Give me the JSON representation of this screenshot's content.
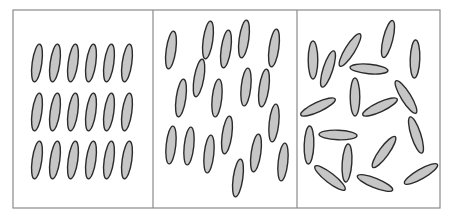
{
  "diagram": {
    "title": "",
    "style": {
      "rod_fill": "#c6c6c6",
      "rod_stroke": "#2b2b2b",
      "frame_stroke": "#8a8a8a",
      "rod_rx": 4.8,
      "rod_ry": 19
    },
    "frame": {
      "x": 13,
      "y": 10,
      "width": 427,
      "height": 198
    },
    "panels": [
      {
        "name": "ordered-lattice",
        "x": 13,
        "width": 140,
        "rods": [
          {
            "cx": 37,
            "cy": 63,
            "angle": 8
          },
          {
            "cx": 55,
            "cy": 63,
            "angle": 8
          },
          {
            "cx": 73,
            "cy": 63,
            "angle": 8
          },
          {
            "cx": 91,
            "cy": 63,
            "angle": 8
          },
          {
            "cx": 109,
            "cy": 63,
            "angle": 8
          },
          {
            "cx": 127,
            "cy": 63,
            "angle": 8
          },
          {
            "cx": 37,
            "cy": 112,
            "angle": 8
          },
          {
            "cx": 55,
            "cy": 112,
            "angle": 8
          },
          {
            "cx": 73,
            "cy": 112,
            "angle": 8
          },
          {
            "cx": 91,
            "cy": 112,
            "angle": 8
          },
          {
            "cx": 109,
            "cy": 112,
            "angle": 8
          },
          {
            "cx": 127,
            "cy": 112,
            "angle": 8
          },
          {
            "cx": 37,
            "cy": 160,
            "angle": 8
          },
          {
            "cx": 55,
            "cy": 160,
            "angle": 8
          },
          {
            "cx": 73,
            "cy": 160,
            "angle": 8
          },
          {
            "cx": 91,
            "cy": 160,
            "angle": 8
          },
          {
            "cx": 109,
            "cy": 160,
            "angle": 8
          },
          {
            "cx": 127,
            "cy": 160,
            "angle": 8
          }
        ]
      },
      {
        "name": "aligned-disordered",
        "x": 153,
        "width": 144,
        "rods": [
          {
            "cx": 171,
            "cy": 50,
            "angle": 8
          },
          {
            "cx": 208,
            "cy": 40,
            "angle": 8
          },
          {
            "cx": 226,
            "cy": 49,
            "angle": 8
          },
          {
            "cx": 244,
            "cy": 39,
            "angle": 8
          },
          {
            "cx": 274,
            "cy": 48,
            "angle": 8
          },
          {
            "cx": 199,
            "cy": 78,
            "angle": 10
          },
          {
            "cx": 181,
            "cy": 98,
            "angle": 8
          },
          {
            "cx": 217,
            "cy": 98,
            "angle": 6
          },
          {
            "cx": 246,
            "cy": 87,
            "angle": 6
          },
          {
            "cx": 264,
            "cy": 88,
            "angle": 8
          },
          {
            "cx": 274,
            "cy": 123,
            "angle": 6
          },
          {
            "cx": 171,
            "cy": 145,
            "angle": 6
          },
          {
            "cx": 189,
            "cy": 146,
            "angle": 6
          },
          {
            "cx": 209,
            "cy": 154,
            "angle": 6
          },
          {
            "cx": 227,
            "cy": 135,
            "angle": 8
          },
          {
            "cx": 256,
            "cy": 153,
            "angle": 8
          },
          {
            "cx": 238,
            "cy": 178,
            "angle": 8
          },
          {
            "cx": 283,
            "cy": 162,
            "angle": 6
          }
        ]
      },
      {
        "name": "random-isotropic",
        "x": 297,
        "width": 143,
        "rods": [
          {
            "cx": 313,
            "cy": 60,
            "angle": 0
          },
          {
            "cx": 328,
            "cy": 69,
            "angle": 18
          },
          {
            "cx": 350,
            "cy": 50,
            "angle": 32
          },
          {
            "cx": 388,
            "cy": 39,
            "angle": 14
          },
          {
            "cx": 415,
            "cy": 59,
            "angle": 2
          },
          {
            "cx": 369,
            "cy": 69,
            "angle": -85
          },
          {
            "cx": 355,
            "cy": 97,
            "angle": 0
          },
          {
            "cx": 318,
            "cy": 107,
            "angle": 65
          },
          {
            "cx": 380,
            "cy": 107,
            "angle": 65
          },
          {
            "cx": 406,
            "cy": 97,
            "angle": -32
          },
          {
            "cx": 309,
            "cy": 145,
            "angle": 2
          },
          {
            "cx": 338,
            "cy": 135,
            "angle": -88
          },
          {
            "cx": 347,
            "cy": 163,
            "angle": 4
          },
          {
            "cx": 384,
            "cy": 152,
            "angle": 36
          },
          {
            "cx": 416,
            "cy": 135,
            "angle": -18
          },
          {
            "cx": 330,
            "cy": 178,
            "angle": -52
          },
          {
            "cx": 375,
            "cy": 183,
            "angle": -68
          },
          {
            "cx": 421,
            "cy": 174,
            "angle": 60
          }
        ]
      }
    ]
  }
}
